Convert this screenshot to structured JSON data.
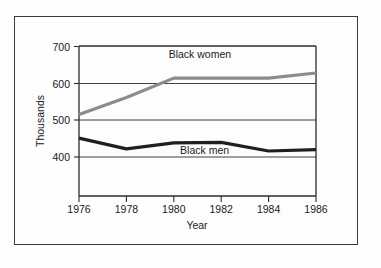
{
  "figure": {
    "frame_color": "#3b3b3b",
    "background_color": "#fdfdfd"
  },
  "chart_data": {
    "type": "line",
    "title": "",
    "xlabel": "Year",
    "ylabel": "Thousands",
    "x": [
      1976,
      1978,
      1980,
      1982,
      1984,
      1986
    ],
    "xtick_labels": [
      "1976",
      "1978",
      "1980",
      "1982",
      "1984",
      "1986"
    ],
    "ytick_labels": [
      "400",
      "500",
      "600",
      "700"
    ],
    "yticks": [
      400,
      500,
      600,
      700
    ],
    "xlim": [
      1976,
      1986
    ],
    "ylim": [
      350,
      700
    ],
    "grid": true,
    "legend_position": "inline-labels",
    "series": [
      {
        "name": "Black women",
        "label": "Black women",
        "color": "#8c8c8c",
        "stroke_width": 3.2,
        "values": [
          540,
          580,
          625,
          625,
          625,
          637
        ],
        "label_x": 1981.1,
        "label_y": 672
      },
      {
        "name": "Black men",
        "label": "Black men",
        "color": "#1f1f1f",
        "stroke_width": 3.2,
        "values": [
          485,
          460,
          474,
          475,
          455,
          458
        ],
        "label_x": 1981.3,
        "label_y": 447
      }
    ]
  }
}
